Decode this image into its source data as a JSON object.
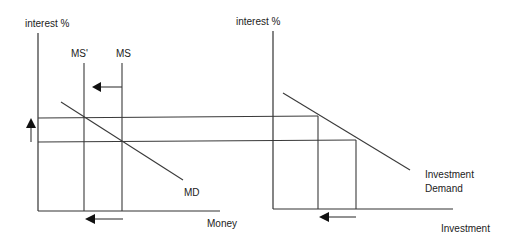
{
  "diagram": {
    "type": "economics-money-market-investment",
    "colors": {
      "line": "#3a3a3a",
      "text": "#222222",
      "background": "#ffffff"
    },
    "left_panel": {
      "y_axis_label": "interest %",
      "x_axis_label": "Money",
      "supply_original_label": "MS",
      "supply_new_label": "MS'",
      "demand_label": "MD",
      "shift_arrow_direction": "left",
      "rate_arrow_direction": "up"
    },
    "right_panel": {
      "y_axis_label": "interest %",
      "x_axis_label": "Investment",
      "demand_label_line1": "Investment",
      "demand_label_line2": "Demand",
      "shift_arrow_direction": "left"
    }
  }
}
